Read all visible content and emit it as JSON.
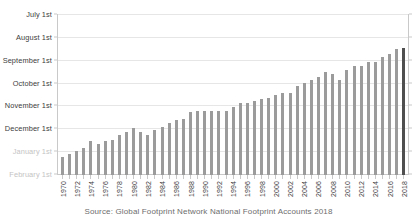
{
  "chart_data": {
    "type": "bar",
    "title": "",
    "subtitle": "",
    "xlabel": "",
    "ylabel": "",
    "source": "Source: Global Footprint Network National Footprint Accounts 2018",
    "grid": true,
    "legend": false,
    "ylim": [
      "July 1st",
      "February 1st"
    ],
    "y_tick_labels": [
      "July 1st",
      "August 1st",
      "September 1st",
      "October 1st",
      "November 1st",
      "December 1st",
      "January 1st",
      "February 1st"
    ],
    "y_tick_muted": [
      false,
      false,
      false,
      false,
      false,
      false,
      true,
      true
    ],
    "x_tick_labels": [
      "1970",
      "1972",
      "1974",
      "1976",
      "1978",
      "1980",
      "1982",
      "1984",
      "1986",
      "1988",
      "1990",
      "1992",
      "1994",
      "1996",
      "1998",
      "2000",
      "2002",
      "2004",
      "2006",
      "2008",
      "2010",
      "2012",
      "2014",
      "2016",
      "2018"
    ],
    "categories": [
      "1970",
      "1971",
      "1972",
      "1973",
      "1974",
      "1975",
      "1976",
      "1977",
      "1978",
      "1979",
      "1980",
      "1981",
      "1982",
      "1983",
      "1984",
      "1985",
      "1986",
      "1987",
      "1988",
      "1989",
      "1990",
      "1991",
      "1992",
      "1993",
      "1994",
      "1995",
      "1996",
      "1997",
      "1998",
      "1999",
      "2000",
      "2001",
      "2002",
      "2003",
      "2004",
      "2005",
      "2006",
      "2007",
      "2008",
      "2009",
      "2010",
      "2011",
      "2012",
      "2013",
      "2014",
      "2015",
      "2016",
      "2017",
      "2018"
    ],
    "values": [
      "December 29",
      "December 25",
      "December 20",
      "December 16",
      "December 7",
      "December 12",
      "December 6",
      "December 3",
      "November 27",
      "November 22",
      "November 17",
      "November 22",
      "November 26",
      "November 20",
      "November 15",
      "November 11",
      "November 6",
      "November 3",
      "October 26",
      "October 24",
      "October 23",
      "October 23",
      "October 24",
      "October 23",
      "October 18",
      "October 12",
      "October 11",
      "October 10",
      "October 8",
      "October 5",
      "September 30",
      "September 29",
      "September 28",
      "September 20",
      "September 15",
      "September 11",
      "September 5",
      "August 31",
      "September 2",
      "September 10",
      "August 28",
      "August 23",
      "August 22",
      "August 19",
      "August 19",
      "August 13",
      "August 8",
      "August 2",
      "August 1"
    ],
    "bar_heights_pct": [
      11,
      13,
      15,
      17,
      21,
      19,
      21,
      22,
      25,
      27,
      29,
      27,
      25,
      28,
      30,
      32,
      34,
      35,
      39,
      40,
      40,
      40,
      40,
      40,
      42,
      45,
      45,
      46,
      47,
      48,
      50,
      51,
      51,
      55,
      57,
      59,
      61,
      64,
      63,
      59,
      65,
      68,
      68,
      70,
      70,
      73,
      75,
      78,
      79
    ],
    "highlight_index": 48,
    "bar_color": "#9b9b9b",
    "highlight_color": "#4f4f4f",
    "gridline_color": "#e6e6e6",
    "axis_color": "#c9c9c9",
    "label_color": "#3c3c3c",
    "muted_label_color": "#c4c4c4"
  }
}
